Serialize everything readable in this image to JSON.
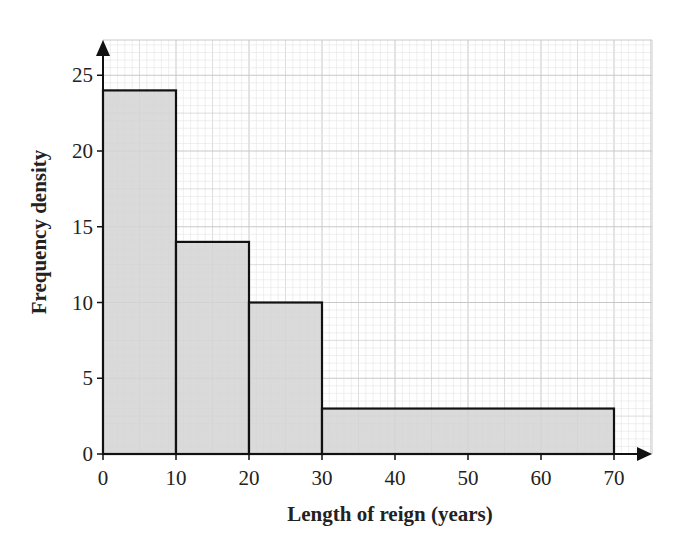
{
  "chart_data": {
    "type": "bar",
    "subtype": "histogram",
    "title": "",
    "xlabel": "Length of reign (years)",
    "ylabel": "Frequency density",
    "bins": [
      {
        "from": 0,
        "to": 10,
        "value": 24
      },
      {
        "from": 10,
        "to": 20,
        "value": 14
      },
      {
        "from": 20,
        "to": 30,
        "value": 10
      },
      {
        "from": 30,
        "to": 70,
        "value": 3
      }
    ],
    "categories": [
      "0-10",
      "10-20",
      "20-30",
      "30-70"
    ],
    "values": [
      24,
      14,
      10,
      3
    ],
    "xticks": [
      0,
      10,
      20,
      30,
      40,
      50,
      60,
      70
    ],
    "yticks": [
      0,
      5,
      10,
      15,
      20,
      25
    ],
    "xlim": [
      0,
      75
    ],
    "ylim": [
      0,
      27
    ],
    "grid": true,
    "legend": null,
    "colors": {
      "bar_fill": "#d4d4d4",
      "bar_edge": "#111111",
      "grid_major": "#c8c8c8",
      "grid_minor": "#e4e4e4",
      "axis": "#111111"
    }
  }
}
